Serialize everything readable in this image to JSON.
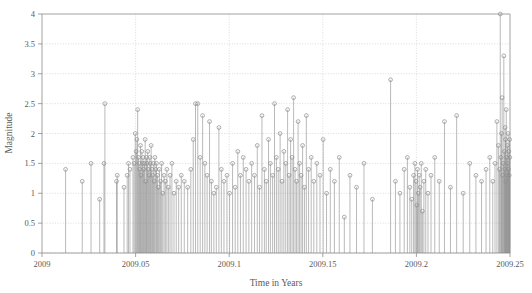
{
  "figure": {
    "background_color": "#ffffff",
    "frame_color": "#8a8a8a",
    "grid_color": "#b9b9b9",
    "stem_color": "#8c8c8c",
    "marker_color": "#8c8c8c",
    "text_color": "#5a5a5a"
  },
  "chart_data": {
    "type": "scatter",
    "title": "",
    "xlabel": "Time in Years",
    "ylabel": "Magnitude",
    "xlim": [
      2009.0,
      2009.25
    ],
    "ylim": [
      0,
      4
    ],
    "grid": true,
    "legend": null,
    "xticks": [
      2009,
      2009.05,
      2009.1,
      2009.15,
      2009.2,
      2009.25
    ],
    "xticklabels": [
      "2009",
      "2009.05",
      "2009.1",
      "2009.15",
      "2009.2",
      "2009.25"
    ],
    "yticks": [
      0,
      0.5,
      1,
      1.5,
      2,
      2.5,
      3,
      3.5,
      4
    ],
    "yticklabels": [
      "0",
      "0.5",
      "1",
      "1.5",
      "2",
      "2.5",
      "3",
      "3.5",
      "4"
    ],
    "marker": "open-circle",
    "stems": true,
    "x": [
      2009.0126,
      2009.0215,
      2009.0262,
      2009.0308,
      2009.0331,
      2009.0336,
      2009.0398,
      2009.0402,
      2009.0438,
      2009.0455,
      2009.0462,
      2009.047,
      2009.0486,
      2009.0492,
      2009.0498,
      2009.0503,
      2009.0507,
      2009.0511,
      2009.0515,
      2009.0519,
      2009.0522,
      2009.0526,
      2009.0529,
      2009.0533,
      2009.0536,
      2009.054,
      2009.0543,
      2009.0547,
      2009.0551,
      2009.0554,
      2009.0558,
      2009.0561,
      2009.0565,
      2009.0568,
      2009.0572,
      2009.0576,
      2009.0579,
      2009.0583,
      2009.0587,
      2009.0591,
      2009.0595,
      2009.0599,
      2009.0603,
      2009.0608,
      2009.0612,
      2009.0617,
      2009.0622,
      2009.0627,
      2009.0633,
      2009.0639,
      2009.0645,
      2009.0652,
      2009.0659,
      2009.0667,
      2009.0675,
      2009.0684,
      2009.0694,
      2009.0705,
      2009.0717,
      2009.073,
      2009.0744,
      2009.076,
      2009.0778,
      2009.0795,
      2009.0808,
      2009.082,
      2009.0832,
      2009.0845,
      2009.0858,
      2009.087,
      2009.0882,
      2009.0895,
      2009.0905,
      2009.0918,
      2009.0931,
      2009.0945,
      2009.0958,
      2009.0972,
      2009.0988,
      2009.1002,
      2009.1018,
      2009.1032,
      2009.1046,
      2009.106,
      2009.1075,
      2009.109,
      2009.1105,
      2009.112,
      2009.1135,
      2009.115,
      2009.1162,
      2009.1175,
      2009.1188,
      2009.1198,
      2009.121,
      2009.122,
      2009.1232,
      2009.1242,
      2009.1252,
      2009.1262,
      2009.1272,
      2009.1282,
      2009.1292,
      2009.1302,
      2009.1312,
      2009.132,
      2009.1328,
      2009.1336,
      2009.1344,
      2009.1352,
      2009.136,
      2009.1368,
      2009.1376,
      2009.1384,
      2009.1392,
      2009.1402,
      2009.1412,
      2009.1424,
      2009.1438,
      2009.1452,
      2009.1468,
      2009.1485,
      2009.1502,
      2009.152,
      2009.154,
      2009.1562,
      2009.1588,
      2009.1615,
      2009.1645,
      2009.168,
      2009.172,
      2009.1765,
      2009.1862,
      2009.1888,
      2009.1912,
      2009.1935,
      2009.1952,
      2009.1965,
      2009.1975,
      2009.1985,
      2009.1992,
      2009.1998,
      2009.2002,
      2009.2006,
      2009.201,
      2009.2015,
      2009.202,
      2009.2026,
      2009.2032,
      2009.204,
      2009.205,
      2009.2062,
      2009.2078,
      2009.2098,
      2009.2122,
      2009.215,
      2009.2182,
      2009.2215,
      2009.225,
      2009.2285,
      2009.2318,
      2009.2348,
      2009.2372,
      2009.2392,
      2009.2408,
      2009.242,
      2009.243,
      2009.2438,
      2009.2444,
      2009.2448,
      2009.2452,
      2009.2455,
      2009.2458,
      2009.2461,
      2009.2464,
      2009.2467,
      2009.247,
      2009.2472,
      2009.2474,
      2009.2476,
      2009.2478,
      2009.248,
      2009.2482,
      2009.2484,
      2009.2486,
      2009.2488,
      2009.249,
      2009.2492,
      2009.2494,
      2009.2496,
      2009.2498,
      2009.2499
    ],
    "y": [
      1.4,
      1.2,
      1.5,
      0.9,
      1.5,
      2.5,
      1.2,
      1.3,
      1.1,
      1.3,
      1.5,
      1.4,
      1.6,
      1.5,
      2.0,
      1.7,
      1.9,
      2.4,
      1.6,
      1.5,
      1.4,
      1.8,
      1.3,
      1.7,
      1.5,
      1.6,
      1.4,
      1.5,
      1.9,
      1.2,
      1.6,
      1.5,
      1.7,
      1.4,
      1.3,
      1.6,
      1.5,
      1.8,
      1.4,
      1.3,
      1.5,
      1.2,
      1.6,
      1.4,
      1.5,
      1.3,
      1.1,
      1.4,
      1.2,
      1.5,
      1.0,
      1.3,
      1.2,
      1.4,
      1.1,
      1.3,
      1.5,
      1.0,
      1.2,
      1.1,
      1.3,
      1.2,
      1.1,
      1.4,
      1.9,
      2.5,
      2.5,
      1.6,
      2.3,
      1.5,
      1.3,
      2.2,
      1.2,
      1.0,
      1.1,
      2.1,
      1.4,
      1.2,
      1.3,
      1.0,
      1.5,
      1.1,
      1.7,
      1.3,
      1.6,
      1.4,
      1.2,
      1.5,
      1.3,
      1.8,
      1.1,
      2.3,
      1.4,
      1.2,
      1.9,
      1.5,
      1.3,
      2.5,
      1.6,
      1.4,
      2.0,
      1.2,
      1.7,
      1.5,
      2.4,
      1.3,
      1.9,
      1.6,
      2.6,
      1.4,
      1.2,
      2.2,
      1.5,
      1.3,
      1.8,
      1.1,
      2.3,
      1.4,
      1.6,
      1.2,
      1.5,
      1.3,
      1.9,
      1.0,
      1.4,
      1.2,
      1.6,
      0.6,
      1.3,
      1.1,
      1.5,
      0.9,
      2.9,
      1.2,
      1.0,
      1.4,
      1.6,
      1.1,
      0.9,
      1.3,
      1.5,
      1.2,
      0.8,
      1.4,
      1.0,
      1.3,
      1.1,
      1.5,
      0.7,
      1.2,
      1.4,
      1.0,
      1.3,
      1.6,
      1.2,
      2.2,
      1.1,
      2.3,
      1.0,
      1.5,
      1.3,
      1.2,
      1.4,
      1.6,
      1.2,
      1.5,
      2.2,
      1.8,
      1.4,
      4.0,
      1.6,
      2.0,
      2.6,
      1.3,
      1.5,
      3.3,
      1.7,
      1.4,
      2.1,
      1.9,
      1.2,
      2.4,
      1.6,
      1.3,
      1.8,
      1.5,
      2.0,
      1.4,
      1.7,
      1.3,
      1.9,
      1.6
    ]
  }
}
